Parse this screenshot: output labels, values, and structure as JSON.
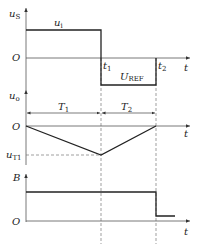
{
  "panels": {
    "top": {
      "y_label": "u",
      "y_label_sub": "S",
      "origin": "O",
      "x_label": "t",
      "segment_high_label": "u",
      "segment_high_sub": "i",
      "segment_low_label": "U",
      "segment_low_sub": "REF",
      "t1": "t",
      "t1_sub": "1",
      "t2": "t",
      "t2_sub": "2"
    },
    "middle": {
      "y_label": "u",
      "y_label_sub": "o",
      "origin": "O",
      "x_label": "t",
      "interval1": "T",
      "interval1_sub": "1",
      "interval2": "T",
      "interval2_sub": "2",
      "min_label": "u",
      "min_label_sub": "T1"
    },
    "bottom": {
      "y_label": "B",
      "origin": "O",
      "x_label": "t"
    }
  },
  "colors": {
    "line": "#222222",
    "axis": "#555555",
    "dashed": "#777777"
  }
}
